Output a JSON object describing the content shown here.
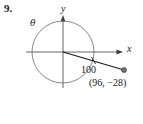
{
  "problem": {
    "number": "9."
  },
  "figure": {
    "axis_labels": {
      "x": "x",
      "y": "y"
    },
    "angle_symbol": "θ",
    "radius_label": "100",
    "point_label": "(96, −28)",
    "colors": {
      "stroke": "#3d3d3d",
      "ray": "#1a1a1a",
      "background": "#ffffff",
      "text": "#1a1a1a"
    },
    "geometry": {
      "origin_x": 63,
      "origin_y": 52,
      "circle_radius": 31,
      "terminal_point_x": 124,
      "terminal_point_y": 70
    }
  }
}
